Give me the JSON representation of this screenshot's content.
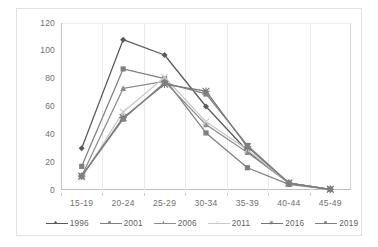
{
  "chart_data": {
    "type": "line",
    "title": "",
    "subtitle": "",
    "xlabel": "",
    "ylabel": "",
    "categories": [
      "15-19",
      "20-24",
      "25-29",
      "30-34",
      "35-39",
      "40-44",
      "45-49"
    ],
    "ylim": [
      0,
      120
    ],
    "y_ticks": [
      0,
      20,
      40,
      60,
      80,
      100,
      120
    ],
    "y_tick_labels": [
      "0",
      "20",
      "40",
      "60",
      "80",
      "100",
      "120"
    ],
    "grid": "vertical",
    "legend_position": "bottom",
    "series": [
      {
        "name": "1996",
        "color": "#595959",
        "marker": "diamond",
        "values": [
          30,
          108,
          97,
          60,
          28,
          5,
          0.5
        ]
      },
      {
        "name": "2001",
        "color": "#808080",
        "marker": "square",
        "values": [
          17,
          87,
          80,
          41,
          16,
          4,
          0.5
        ]
      },
      {
        "name": "2006",
        "color": "#8c8c8c",
        "marker": "triangle",
        "values": [
          10,
          73,
          78,
          47,
          27,
          5,
          0.5
        ]
      },
      {
        "name": "2011",
        "color": "#c9c9c9",
        "marker": "cross",
        "values": [
          9,
          56,
          81,
          49,
          29,
          5,
          0.5
        ]
      },
      {
        "name": "2016",
        "color": "#737373",
        "marker": "star",
        "values": [
          10,
          52,
          76,
          71,
          31,
          5,
          0.5
        ]
      },
      {
        "name": "2019",
        "color": "#7f7f7f",
        "marker": "square",
        "values": [
          10,
          51,
          77,
          69,
          32,
          5,
          0.5
        ]
      }
    ]
  },
  "legend": {
    "items": [
      {
        "label": "1996"
      },
      {
        "label": "2001"
      },
      {
        "label": "2006"
      },
      {
        "label": "2011"
      },
      {
        "label": "2016"
      },
      {
        "label": "2019"
      }
    ]
  },
  "colors": {
    "plot_border": "#bfbfbf",
    "gridline": "#e9e9e9",
    "axis_text": "#6f6f6f",
    "frame": "#e2e2e2"
  }
}
